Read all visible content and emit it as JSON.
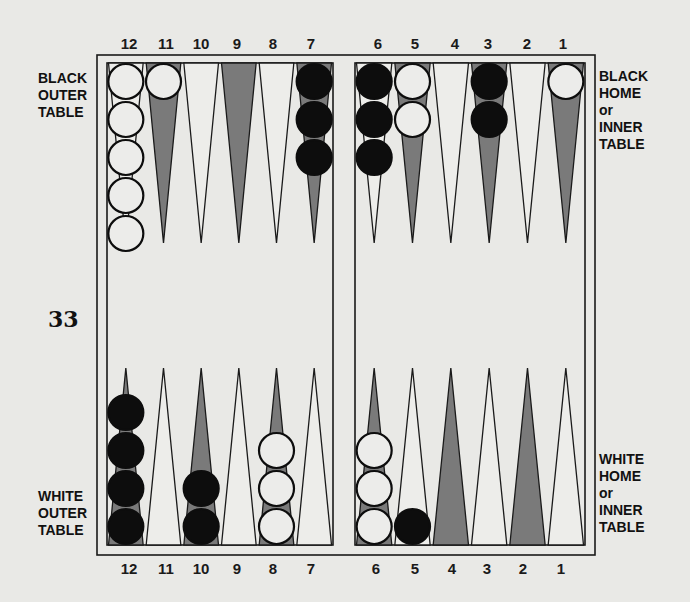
{
  "figure_number": "33",
  "labels": {
    "black_outer": [
      "BLACK",
      "OUTER",
      "TABLE"
    ],
    "black_home": [
      "BLACK",
      "HOME",
      "or",
      "INNER",
      "TABLE"
    ],
    "white_outer": [
      "WHITE",
      "OUTER",
      "TABLE"
    ],
    "white_home": [
      "WHITE",
      "HOME",
      "or",
      "INNER",
      "TABLE"
    ]
  },
  "point_numbers": {
    "top": [
      "12",
      "11",
      "10",
      "9",
      "8",
      "7",
      "6",
      "5",
      "4",
      "3",
      "2",
      "1"
    ],
    "bottom": [
      "12",
      "11",
      "10",
      "9",
      "8",
      "7",
      "6",
      "5",
      "4",
      "3",
      "2",
      "1"
    ]
  },
  "colors": {
    "background": "#e9e9e6",
    "board_line": "#1a1a1a",
    "dark_point": "#7a7a7a",
    "light_point": "#ededea",
    "black_checker": "#0d0d0d",
    "white_checker": "#ececea"
  },
  "board": {
    "top_row": [
      {
        "label": "12",
        "shade": "light",
        "checkers": {
          "color": "white",
          "count": 5
        }
      },
      {
        "label": "11",
        "shade": "dark",
        "checkers": {
          "color": "white",
          "count": 1
        }
      },
      {
        "label": "10",
        "shade": "light",
        "checkers": {
          "color": null,
          "count": 0
        }
      },
      {
        "label": "9",
        "shade": "dark",
        "checkers": {
          "color": null,
          "count": 0
        }
      },
      {
        "label": "8",
        "shade": "light",
        "checkers": {
          "color": null,
          "count": 0
        }
      },
      {
        "label": "7",
        "shade": "dark",
        "checkers": {
          "color": "black",
          "count": 3
        }
      },
      {
        "label": "6",
        "shade": "light",
        "checkers": {
          "color": "black",
          "count": 3
        }
      },
      {
        "label": "5",
        "shade": "dark",
        "checkers": {
          "color": "white",
          "count": 2
        }
      },
      {
        "label": "4",
        "shade": "light",
        "checkers": {
          "color": null,
          "count": 0
        }
      },
      {
        "label": "3",
        "shade": "dark",
        "checkers": {
          "color": "black",
          "count": 2
        }
      },
      {
        "label": "2",
        "shade": "light",
        "checkers": {
          "color": null,
          "count": 0
        }
      },
      {
        "label": "1",
        "shade": "dark",
        "checkers": {
          "color": "white",
          "count": 1
        }
      }
    ],
    "bottom_row": [
      {
        "label": "12",
        "shade": "dark",
        "checkers": {
          "color": "black",
          "count": 4
        }
      },
      {
        "label": "11",
        "shade": "light",
        "checkers": {
          "color": null,
          "count": 0
        }
      },
      {
        "label": "10",
        "shade": "dark",
        "checkers": {
          "color": "black",
          "count": 2
        }
      },
      {
        "label": "9",
        "shade": "light",
        "checkers": {
          "color": null,
          "count": 0
        }
      },
      {
        "label": "8",
        "shade": "dark",
        "checkers": {
          "color": "white",
          "count": 3
        }
      },
      {
        "label": "7",
        "shade": "light",
        "checkers": {
          "color": null,
          "count": 0
        }
      },
      {
        "label": "6",
        "shade": "dark",
        "checkers": {
          "color": "white",
          "count": 3
        }
      },
      {
        "label": "5",
        "shade": "light",
        "checkers": {
          "color": "black",
          "count": 1
        }
      },
      {
        "label": "4",
        "shade": "dark",
        "checkers": {
          "color": null,
          "count": 0
        }
      },
      {
        "label": "3",
        "shade": "light",
        "checkers": {
          "color": null,
          "count": 0
        }
      },
      {
        "label": "2",
        "shade": "dark",
        "checkers": {
          "color": null,
          "count": 0
        }
      },
      {
        "label": "1",
        "shade": "light",
        "checkers": {
          "color": null,
          "count": 0
        }
      }
    ]
  }
}
